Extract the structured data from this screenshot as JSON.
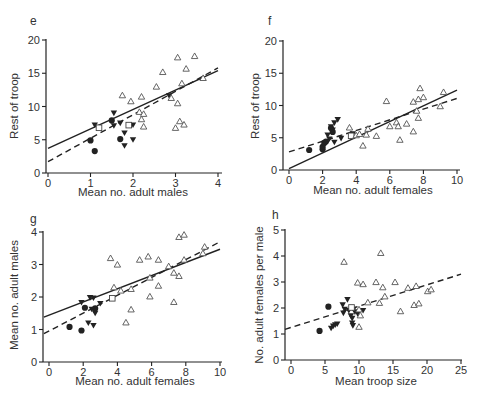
{
  "chart_data": [
    {
      "type": "scatter",
      "panel": "e",
      "xlabel": "Mean no. adult males",
      "ylabel": "Rest of troop",
      "xlim": [
        0,
        4
      ],
      "ylim": [
        0,
        20
      ],
      "xticks": [
        0,
        1,
        2,
        3,
        4
      ],
      "yticks": [
        0,
        5,
        10,
        15,
        20
      ],
      "grid": false,
      "lines": [
        {
          "style": "solid",
          "x": [
            0,
            4
          ],
          "y": [
            3.7,
            15.4
          ]
        },
        {
          "style": "dashed",
          "x": [
            0,
            4
          ],
          "y": [
            1.7,
            15.8
          ]
        }
      ],
      "series": [
        {
          "marker": "filled-circle",
          "points": [
            [
              1.0,
              4.9
            ],
            [
              1.1,
              3.3
            ],
            [
              1.5,
              7.9
            ],
            [
              1.7,
              5.1
            ]
          ]
        },
        {
          "marker": "filled-triangle-down",
          "points": [
            [
              1.1,
              7.2
            ],
            [
              1.55,
              9.0
            ],
            [
              1.55,
              7.1
            ],
            [
              1.7,
              7.5
            ],
            [
              1.8,
              6.0
            ],
            [
              1.8,
              4.1
            ],
            [
              2.0,
              7.2
            ],
            [
              2.0,
              5.0
            ],
            [
              2.85,
              11.6
            ]
          ]
        },
        {
          "marker": "open-square",
          "points": [
            [
              1.2,
              6.8
            ],
            [
              1.9,
              7.2
            ]
          ]
        },
        {
          "marker": "open-triangle-up",
          "points": [
            [
              1.75,
              11.7
            ],
            [
              1.95,
              10.8
            ],
            [
              2.2,
              11.5
            ],
            [
              2.15,
              9.2
            ],
            [
              2.2,
              8.1
            ],
            [
              2.25,
              8.9
            ],
            [
              2.25,
              7.0
            ],
            [
              2.55,
              13.0
            ],
            [
              2.7,
              15.2
            ],
            [
              2.9,
              11.3
            ],
            [
              3.0,
              6.8
            ],
            [
              3.05,
              17.4
            ],
            [
              3.05,
              10.5
            ],
            [
              3.1,
              7.8
            ],
            [
              3.15,
              13.5
            ],
            [
              3.2,
              7.3
            ],
            [
              3.25,
              15.7
            ],
            [
              3.45,
              17.6
            ],
            [
              3.65,
              14.3
            ]
          ]
        }
      ]
    },
    {
      "type": "scatter",
      "panel": "f",
      "xlabel": "Mean no. adult females",
      "ylabel": "Rest of troop",
      "xlim": [
        0,
        10
      ],
      "ylim": [
        0,
        20
      ],
      "xticks": [
        0,
        2,
        4,
        6,
        8,
        10
      ],
      "yticks": [
        0,
        5,
        10,
        15,
        20
      ],
      "grid": false,
      "lines": [
        {
          "style": "solid",
          "x": [
            0,
            10
          ],
          "y": [
            0.2,
            12.4
          ]
        },
        {
          "style": "dashed",
          "x": [
            0,
            10
          ],
          "y": [
            2.8,
            11.1
          ]
        }
      ],
      "series": [
        {
          "marker": "filled-circle",
          "points": [
            [
              1.2,
              3.1
            ],
            [
              2.0,
              3.2
            ],
            [
              2.0,
              3.6
            ],
            [
              2.1,
              4.2
            ],
            [
              2.2,
              4.4
            ],
            [
              2.5,
              6.5
            ],
            [
              2.6,
              5.9
            ]
          ]
        },
        {
          "marker": "filled-triangle-down",
          "points": [
            [
              2.3,
              5.4
            ],
            [
              2.4,
              4.8
            ],
            [
              2.5,
              6.7
            ],
            [
              2.6,
              6.2
            ],
            [
              2.7,
              7.3
            ],
            [
              2.7,
              4.3
            ],
            [
              2.9,
              7.8
            ],
            [
              3.1,
              4.9
            ],
            [
              3.8,
              5.6
            ]
          ]
        },
        {
          "marker": "open-square",
          "points": [
            [
              3.7,
              5.3
            ]
          ]
        },
        {
          "marker": "open-triangle-up",
          "points": [
            [
              3.6,
              6.6
            ],
            [
              4.0,
              5.4
            ],
            [
              4.2,
              5.6
            ],
            [
              4.4,
              3.8
            ],
            [
              4.6,
              5.5
            ],
            [
              4.7,
              6.4
            ],
            [
              5.2,
              5.3
            ],
            [
              5.8,
              10.7
            ],
            [
              6.0,
              6.8
            ],
            [
              6.4,
              7.4
            ],
            [
              6.5,
              6.8
            ],
            [
              6.6,
              4.7
            ],
            [
              7.0,
              7.2
            ],
            [
              7.4,
              6.0
            ],
            [
              7.4,
              10.6
            ],
            [
              7.6,
              9.2
            ],
            [
              7.7,
              8.1
            ],
            [
              7.7,
              11.0
            ],
            [
              7.8,
              12.7
            ],
            [
              8.0,
              11.3
            ],
            [
              9.0,
              9.9
            ],
            [
              9.2,
              12.1
            ]
          ]
        }
      ]
    },
    {
      "type": "scatter",
      "panel": "g",
      "xlabel": "Mean no. adult females",
      "ylabel": "Mean no. adult males",
      "xlim": [
        0,
        10
      ],
      "ylim": [
        0,
        4
      ],
      "xticks": [
        0,
        2,
        4,
        6,
        8,
        10
      ],
      "yticks": [
        0,
        1,
        2,
        3,
        4
      ],
      "grid": false,
      "lines": [
        {
          "style": "solid",
          "x": [
            -0.3,
            10
          ],
          "y": [
            1.38,
            3.47
          ]
        },
        {
          "style": "dashed",
          "x": [
            -0.3,
            10
          ],
          "y": [
            0.87,
            3.7
          ]
        }
      ],
      "series": [
        {
          "marker": "filled-circle",
          "points": [
            [
              1.2,
              1.08
            ],
            [
              1.9,
              0.97
            ],
            [
              2.1,
              1.67
            ],
            [
              2.7,
              1.65
            ]
          ]
        },
        {
          "marker": "filled-triangle-down",
          "points": [
            [
              1.9,
              1.83
            ],
            [
              2.3,
              1.2
            ],
            [
              2.4,
              1.98
            ],
            [
              2.5,
              1.62
            ],
            [
              2.6,
              1.12
            ],
            [
              2.6,
              1.97
            ],
            [
              2.7,
              1.5
            ],
            [
              3.0,
              1.8
            ]
          ]
        },
        {
          "marker": "open-square",
          "points": [
            [
              3.7,
              1.96
            ]
          ]
        },
        {
          "marker": "open-triangle-up",
          "points": [
            [
              3.6,
              3.2
            ],
            [
              3.8,
              2.3
            ],
            [
              4.0,
              3.0
            ],
            [
              4.2,
              2.2
            ],
            [
              4.5,
              1.22
            ],
            [
              4.8,
              1.62
            ],
            [
              4.8,
              2.25
            ],
            [
              5.3,
              3.15
            ],
            [
              5.8,
              3.25
            ],
            [
              5.9,
              2.6
            ],
            [
              5.9,
              2.02
            ],
            [
              6.4,
              2.35
            ],
            [
              6.4,
              3.15
            ],
            [
              7.0,
              2.95
            ],
            [
              7.3,
              1.85
            ],
            [
              7.3,
              2.75
            ],
            [
              7.6,
              2.65
            ],
            [
              7.6,
              3.85
            ],
            [
              7.9,
              3.92
            ],
            [
              7.9,
              3.15
            ],
            [
              9.0,
              3.35
            ],
            [
              9.1,
              3.55
            ]
          ]
        }
      ]
    },
    {
      "type": "scatter",
      "panel": "h",
      "xlabel": "Mean troop size",
      "ylabel": "No. adult females per male",
      "xlim": [
        0,
        25
      ],
      "ylim": [
        0,
        5
      ],
      "xticks": [
        0,
        5,
        10,
        15,
        20,
        25
      ],
      "yticks": [
        0,
        1,
        2,
        3,
        4,
        5
      ],
      "grid": false,
      "lines": [
        {
          "style": "dashed",
          "x": [
            -1,
            25
          ],
          "y": [
            1.18,
            3.3
          ]
        }
      ],
      "series": [
        {
          "marker": "filled-circle",
          "points": [
            [
              4.2,
              1.12
            ],
            [
              5.5,
              2.05
            ]
          ]
        },
        {
          "marker": "filled-triangle-down",
          "points": [
            [
              5.9,
              1.22
            ],
            [
              6.2,
              1.3
            ],
            [
              6.5,
              1.35
            ],
            [
              6.8,
              1.38
            ],
            [
              7.6,
              2.12
            ],
            [
              7.7,
              1.8
            ],
            [
              7.9,
              1.95
            ],
            [
              8.3,
              2.32
            ],
            [
              8.5,
              1.9
            ],
            [
              8.8,
              1.7
            ],
            [
              9.0,
              1.6
            ],
            [
              9.0,
              1.42
            ],
            [
              9.1,
              1.32
            ],
            [
              9.2,
              1.95
            ],
            [
              9.4,
              1.85
            ],
            [
              9.8,
              1.78
            ],
            [
              10.6,
              1.9
            ]
          ]
        },
        {
          "marker": "open-square",
          "points": [
            [
              8.9,
              2.02
            ]
          ]
        },
        {
          "marker": "open-triangle-up",
          "points": [
            [
              7.8,
              3.78
            ],
            [
              9.8,
              2.98
            ],
            [
              10.0,
              1.28
            ],
            [
              10.0,
              1.95
            ],
            [
              10.2,
              1.72
            ],
            [
              10.6,
              2.92
            ],
            [
              11.3,
              2.22
            ],
            [
              12.5,
              3.0
            ],
            [
              13.0,
              2.2
            ],
            [
              13.2,
              4.12
            ],
            [
              13.5,
              2.8
            ],
            [
              13.8,
              2.45
            ],
            [
              15.3,
              3.0
            ],
            [
              16.1,
              1.88
            ],
            [
              17.2,
              2.78
            ],
            [
              18.1,
              2.12
            ],
            [
              18.4,
              2.85
            ],
            [
              18.8,
              2.18
            ],
            [
              20.1,
              2.65
            ],
            [
              20.6,
              2.72
            ]
          ]
        }
      ]
    }
  ]
}
